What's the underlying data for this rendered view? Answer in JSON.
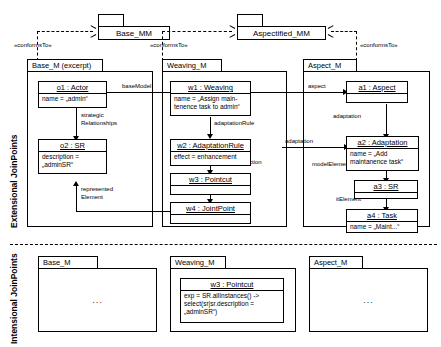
{
  "diagram": {
    "section_labels": {
      "extensional": "Extensional JoinPoints",
      "intensional": "Intensional JoinPoints"
    },
    "metamodels": [
      {
        "id": "base_mm",
        "name": "Base_MM"
      },
      {
        "id": "aspectified_mm",
        "name": "Aspectified_MM"
      }
    ],
    "conforms_labels": {
      "base": "«conformsTo»",
      "weaving": "«conformsTo»",
      "aspect": "«conformsTo»"
    },
    "extensional": {
      "packages": [
        {
          "id": "base_m",
          "name": "Base_M (excerpt)"
        },
        {
          "id": "weaving_m",
          "name": "Weaving_M"
        },
        {
          "id": "aspect_m",
          "name": "Aspect_M"
        }
      ],
      "objects": [
        {
          "id": "o1",
          "name": "o1 : Actor",
          "attrs": [
            "name = „admin“"
          ]
        },
        {
          "id": "o2",
          "name": "o2 : SR",
          "attrs": [
            "description =",
            "    „adminSR“"
          ]
        },
        {
          "id": "w1",
          "name": "w1 : Weaving",
          "attrs": [
            "name = „Assign main-",
            "  tenence task to admin“"
          ]
        },
        {
          "id": "w2",
          "name": "w2 : AdaptationRule",
          "attrs": [
            "effect = enhancement"
          ]
        },
        {
          "id": "w3",
          "name": "w3 : Pointcut",
          "attrs": []
        },
        {
          "id": "w4",
          "name": "w4 : JointPoint",
          "attrs": []
        },
        {
          "id": "a1",
          "name": "a1 : Aspect",
          "attrs": []
        },
        {
          "id": "a2",
          "name": "a2 : Adaptation",
          "attrs": [
            "name = „Add",
            "  maintanence task“"
          ]
        },
        {
          "id": "a3",
          "name": "a3 : SR",
          "attrs": []
        },
        {
          "id": "a4",
          "name": "a4 : Task",
          "attrs": [
            "name = „Maint...“"
          ]
        }
      ],
      "links": [
        {
          "id": "baseModel",
          "label": "baseModel",
          "from": "w1",
          "to": "o1"
        },
        {
          "id": "strategicRelationships",
          "label_line1": "strategic",
          "label_line2": "Relationships",
          "from": "o1",
          "to": "o2"
        },
        {
          "id": "representedElement",
          "label_line1": "represented",
          "label_line2": "Element",
          "from": "w4",
          "to": "o2"
        },
        {
          "id": "adaptationRule",
          "label": "adaptationRule",
          "from": "w1",
          "to": "w2"
        },
        {
          "id": "joinPointSelection",
          "label": "joinPointSelection",
          "from": "w2",
          "to": "w3"
        },
        {
          "id": "joinPoint",
          "label": "joinPoint",
          "from": "w3",
          "to": "w4"
        },
        {
          "id": "aspect",
          "label": "aspect",
          "from": "w1",
          "to": "a1"
        },
        {
          "id": "adaptation_link",
          "label": "adaptation",
          "from": "w2",
          "to": "a2"
        },
        {
          "id": "adaptation",
          "label": "adaptation",
          "from": "a1",
          "to": "a2"
        },
        {
          "id": "modelElement",
          "label": "modelElement",
          "from": "a2",
          "to": "a3"
        },
        {
          "id": "itElement",
          "label": "itElement",
          "from": "a3",
          "to": "a4"
        }
      ]
    },
    "intensional": {
      "packages": [
        {
          "id": "base_m_i",
          "name": "Base_M",
          "content": "..."
        },
        {
          "id": "weaving_m_i",
          "name": "Weaving_M",
          "content": "..."
        },
        {
          "id": "aspect_m_i",
          "name": "Aspect_M",
          "content": "..."
        }
      ],
      "objects": [
        {
          "id": "w3_i",
          "name": "w3 : Pointcut",
          "attrs": [
            "exp = SR.allInstances() ->",
            "   select(sr|sr.description =",
            "        „adminSR“)"
          ]
        }
      ]
    },
    "colors": {
      "line": "#000000",
      "background": "#ffffff",
      "fill": "#ffffff"
    }
  }
}
